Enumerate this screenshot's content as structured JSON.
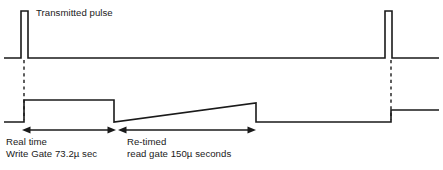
{
  "figure": {
    "title_label": "Transmitted pulse",
    "background_color": "#ffffff",
    "line_color": "#1a1a1a"
  },
  "annotations": {
    "transmitted_pulse": "Transmitted pulse",
    "real_time_line1": "Real time",
    "real_time_line2": "Write Gate 73.2µ sec",
    "re_timed_line1": "Re-timed",
    "re_timed_line2": "read gate 150µ seconds"
  },
  "chart_data": {
    "type": "line",
    "title": "Transmitted pulse",
    "xlabel": "",
    "ylabel": "",
    "grid": false,
    "legend_position": "none",
    "xlim": [
      4,
      439
    ],
    "series": [
      {
        "name": "Transmitted pulse train",
        "comment": "Top trace: narrow rectangular pulses on a baseline",
        "points": [
          [
            4,
            58
          ],
          [
            21,
            58
          ],
          [
            21,
            11
          ],
          [
            28,
            11
          ],
          [
            28,
            58
          ],
          [
            385,
            58
          ],
          [
            385,
            11
          ],
          [
            392,
            11
          ],
          [
            392,
            58
          ],
          [
            439,
            58
          ]
        ]
      },
      {
        "name": "Gate waveform",
        "comment": "Lower trace: write gate rectangle, re-timed read gate ramp, then step",
        "points": [
          [
            4,
            122
          ],
          [
            24,
            122
          ],
          [
            24,
            100
          ],
          [
            114,
            100
          ],
          [
            114,
            122
          ],
          [
            256,
            103
          ],
          [
            256,
            122
          ],
          [
            391,
            122
          ],
          [
            391,
            110
          ],
          [
            439,
            110
          ]
        ]
      }
    ],
    "droplines": [
      {
        "name": "pulse-1-dropline",
        "x": 24,
        "y_top": 60,
        "y_bottom": 120
      },
      {
        "name": "pulse-2-dropline",
        "x": 391,
        "y_top": 60,
        "y_bottom": 120
      }
    ],
    "dimensions": [
      {
        "name": "real-time-write-gate",
        "label_line1": "Real time",
        "label_line2": "Write Gate 73.2µ sec",
        "value": 73.2,
        "unit": "µ sec",
        "x_start": 22,
        "x_end": 116,
        "y": 130
      },
      {
        "name": "re-timed-read-gate",
        "label_line1": "Re-timed",
        "label_line2": "read gate 150µ seconds",
        "value": 150,
        "unit": "µ seconds",
        "x_start": 118,
        "x_end": 256,
        "y": 130
      }
    ]
  }
}
